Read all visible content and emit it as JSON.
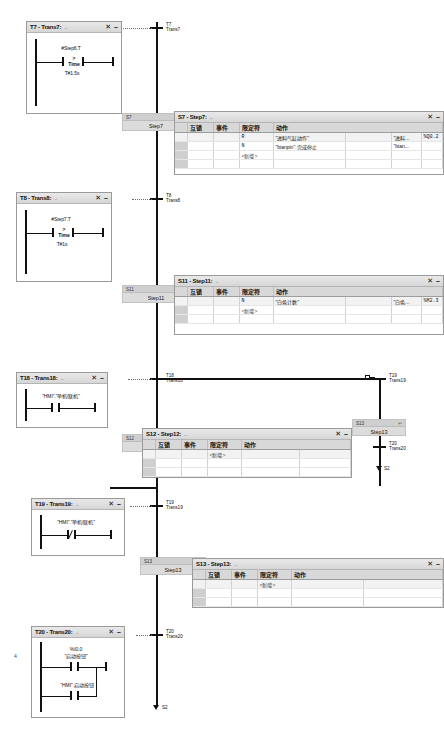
{
  "app": {
    "domain": "plc-sfc-editor",
    "page_marker": "4"
  },
  "lad_windows": [
    {
      "id": "t7",
      "title": "T7 - Trans7:",
      "dots": "...",
      "close": "✕",
      "minimize": "–",
      "network": {
        "type": "compare",
        "operand_top": "#Step6.T",
        "operator": ">",
        "datatype": "Time",
        "operand_bottom": "T#1.5s"
      }
    },
    {
      "id": "t8",
      "title": "T8 - Trans8:",
      "dots": "...",
      "close": "✕",
      "minimize": "–",
      "network": {
        "type": "compare",
        "operand_top": "#Step7.T",
        "operator": ">",
        "datatype": "Time",
        "operand_bottom": "T#1s"
      }
    },
    {
      "id": "t18",
      "title": "T18 - Trans18:",
      "dots": "...",
      "close": "✕",
      "minimize": "–",
      "network": {
        "type": "contact_no",
        "operand_top": "\"HMI\".\"单机/联机\""
      }
    },
    {
      "id": "t19",
      "title": "T19 - Trans19:",
      "dots": "...",
      "close": "✕",
      "minimize": "–",
      "network": {
        "type": "contact_nc",
        "operand_top": "\"HMI\".\"单机/联机\""
      }
    },
    {
      "id": "t20",
      "title": "T20 - Trans20:",
      "dots": "...",
      "close": "✕",
      "minimize": "–",
      "network": {
        "type": "parallel_contacts",
        "branch1_addr": "%I0.0",
        "branch1_name": "\"启动按钮\"",
        "branch2_name": "\"HMI\".启动按钮"
      }
    }
  ],
  "action_windows": [
    {
      "id": "s7",
      "title": "S7 - Step7:",
      "dots": "...",
      "close": "✕",
      "minimize": "–",
      "headers": [
        "互锁",
        "事件",
        "限定符",
        "动作"
      ],
      "rows": [
        {
          "interlock": "",
          "event": "",
          "qualifier": "R",
          "action": "\"进料气缸动作\"",
          "tag": "\"进料...",
          "address": "%Q0.2"
        },
        {
          "interlock": "",
          "event": "",
          "qualifier": "N",
          "action": "\"bianpin\".完成停止",
          "tag": "\"bian...",
          "address": ""
        },
        {
          "interlock": "",
          "event": "",
          "qualifier": "<新增>",
          "action": "",
          "tag": "",
          "address": ""
        }
      ]
    },
    {
      "id": "s11",
      "title": "S11 - Step11:",
      "dots": "...",
      "close": "✕",
      "minimize": "–",
      "headers": [
        "互锁",
        "事件",
        "限定符",
        "动作"
      ],
      "rows": [
        {
          "interlock": "",
          "event": "",
          "qualifier": "N",
          "action": "\"白色计数\"",
          "tag": "\"白色...",
          "address": "%M2.3"
        },
        {
          "interlock": "",
          "event": "",
          "qualifier": "<新增>",
          "action": "",
          "tag": "",
          "address": ""
        }
      ]
    },
    {
      "id": "s12",
      "title": "S12 - Step12:",
      "dots": "...",
      "close": "✕",
      "minimize": "–",
      "headers": [
        "互锁",
        "事件",
        "限定符",
        "动作"
      ],
      "rows": [
        {
          "interlock": "",
          "event": "",
          "qualifier": "<新增>",
          "action": "",
          "tag": "",
          "address": ""
        }
      ]
    },
    {
      "id": "s13",
      "title": "S13 - Step13:",
      "dots": "...",
      "close": "✕",
      "minimize": "–",
      "headers": [
        "互锁",
        "事件",
        "限定符",
        "动作"
      ],
      "rows": [
        {
          "interlock": "",
          "event": "",
          "qualifier": "<新增>",
          "action": "",
          "tag": "",
          "address": ""
        }
      ]
    }
  ],
  "sfc": {
    "transitions": [
      {
        "id": "t7",
        "num": "T7",
        "name": "Trans7"
      },
      {
        "id": "t8",
        "num": "T8",
        "name": "Trans8"
      },
      {
        "id": "t18",
        "num": "T18",
        "name": "Trans18"
      },
      {
        "id": "t19a",
        "num": "T19",
        "name": "Trans19"
      },
      {
        "id": "t19b",
        "num": "T19",
        "name": "Trans19"
      },
      {
        "id": "t20",
        "num": "T20",
        "name": "Trans20"
      }
    ],
    "steps": [
      {
        "id": "s7",
        "num": "S7",
        "name": "Step7",
        "badge": "III"
      },
      {
        "id": "s11",
        "num": "S11",
        "name": "Step11",
        "badge": ""
      },
      {
        "id": "s12",
        "num": "S12",
        "name": "Step12",
        "badge": "↵"
      },
      {
        "id": "s13r",
        "num": "S13",
        "name": "Step13",
        "badge": "↵"
      },
      {
        "id": "s13l",
        "num": "S13",
        "name": "Step13",
        "badge": ""
      }
    ],
    "jumps": [
      {
        "id": "jump-s2-mid",
        "label": "S2"
      },
      {
        "id": "jump-s2-bottom",
        "label": "S2"
      }
    ]
  }
}
